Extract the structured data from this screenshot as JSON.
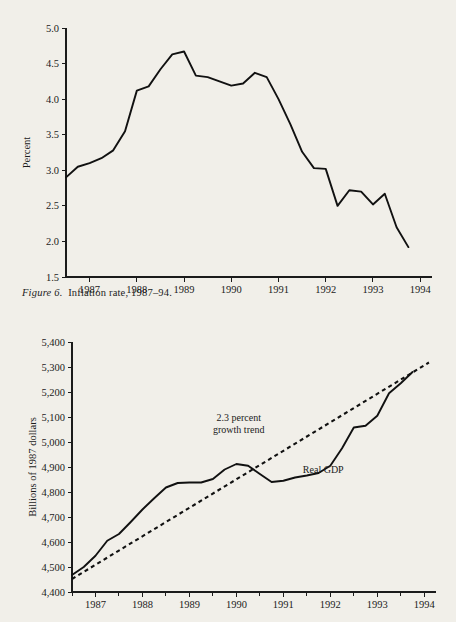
{
  "page": {
    "background_color": "#f1efe9",
    "ink_color": "#1b1b1b"
  },
  "caption": {
    "label": "Figure 6.",
    "text": "Inflation rate, 1987–94."
  },
  "chart_data": [
    {
      "id": "inflation",
      "type": "line",
      "title": "",
      "xlabel": "",
      "ylabel": "Percent",
      "xlim": [
        1986.5,
        1994.25
      ],
      "ylim": [
        1.5,
        5.0
      ],
      "grid": false,
      "legend": "none",
      "xticks": [
        1987,
        1988,
        1989,
        1990,
        1991,
        1992,
        1993,
        1994
      ],
      "xtick_labels": [
        "1987",
        "1988",
        "1989",
        "1990",
        "1991",
        "1992",
        "1993",
        "1994"
      ],
      "yticks": [
        1.5,
        2.0,
        2.5,
        3.0,
        3.5,
        4.0,
        4.5,
        5.0
      ],
      "ytick_labels": [
        "1.5",
        "2.0",
        "2.5",
        "3.0",
        "3.5",
        "4.0",
        "4.5",
        "5.0"
      ],
      "series": [
        {
          "name": "Inflation rate",
          "x": [
            1986.5,
            1986.75,
            1987.0,
            1987.25,
            1987.5,
            1987.75,
            1988.0,
            1988.25,
            1988.5,
            1988.75,
            1989.0,
            1989.25,
            1989.5,
            1989.75,
            1990.0,
            1990.25,
            1990.5,
            1990.75,
            1991.0,
            1991.25,
            1991.5,
            1991.75,
            1992.0,
            1992.25,
            1992.5,
            1992.75,
            1993.0,
            1993.25,
            1993.5,
            1993.75
          ],
          "values": [
            2.9,
            3.05,
            3.1,
            3.17,
            3.28,
            3.55,
            4.12,
            4.18,
            4.42,
            4.63,
            4.67,
            4.33,
            4.31,
            4.25,
            4.19,
            4.22,
            4.37,
            4.31,
            4.0,
            3.65,
            3.26,
            3.03,
            3.02,
            2.5,
            2.72,
            2.7,
            2.52,
            2.67,
            2.2,
            1.92,
            2.15
          ]
        }
      ]
    },
    {
      "id": "real-gdp",
      "type": "line",
      "title": "",
      "xlabel": "",
      "ylabel": "Billions of 1987 dollars",
      "xlim": [
        1986.5,
        1994.25
      ],
      "ylim": [
        4400,
        5400
      ],
      "grid": false,
      "legend": "inline-annotations",
      "xticks": [
        1987,
        1988,
        1989,
        1990,
        1991,
        1992,
        1993,
        1994
      ],
      "xtick_labels": [
        "1987",
        "1988",
        "1989",
        "1990",
        "1991",
        "1992",
        "1993",
        "1994"
      ],
      "xminorticks": [
        1986.5,
        1987.5,
        1988.5,
        1989.5,
        1990.5,
        1991.5,
        1992.5,
        1993.5
      ],
      "yticks": [
        4400,
        4500,
        4600,
        4700,
        4800,
        4900,
        5000,
        5100,
        5200,
        5300,
        5400
      ],
      "ytick_labels": [
        "4,400",
        "4,500",
        "4,600",
        "4,700",
        "4,800",
        "4,900",
        "5,000",
        "5,100",
        "5,200",
        "5,300",
        "5,400"
      ],
      "annotations": [
        {
          "name": "trend-annotation",
          "text_line1": "2.3 percent",
          "text_line2": "growth trend",
          "x": 1990.05,
          "y": 5085
        },
        {
          "name": "series-annotation",
          "text_line1": "Real GDP",
          "text_line2": "",
          "x": 1991.85,
          "y": 4875
        }
      ],
      "series": [
        {
          "name": "Real GDP",
          "style": "solid",
          "x": [
            1986.5,
            1986.75,
            1987.0,
            1987.25,
            1987.5,
            1987.75,
            1988.0,
            1988.25,
            1988.5,
            1988.75,
            1989.0,
            1989.25,
            1989.5,
            1989.75,
            1990.0,
            1990.25,
            1990.5,
            1990.75,
            1991.0,
            1991.25,
            1991.5,
            1991.75,
            1992.0,
            1992.25,
            1992.5,
            1992.75,
            1993.0,
            1993.25,
            1993.5,
            1993.75
          ],
          "values": [
            4468,
            4500,
            4545,
            4605,
            4632,
            4680,
            4730,
            4775,
            4818,
            4836,
            4838,
            4838,
            4852,
            4890,
            4912,
            4905,
            4872,
            4840,
            4845,
            4858,
            4866,
            4876,
            4905,
            4975,
            5058,
            5065,
            5105,
            5195,
            5235,
            5280
          ]
        },
        {
          "name": "2.3 percent growth trend",
          "style": "dashed",
          "x": [
            1986.5,
            1994.1
          ],
          "values": [
            4452,
            5318
          ]
        }
      ]
    }
  ]
}
